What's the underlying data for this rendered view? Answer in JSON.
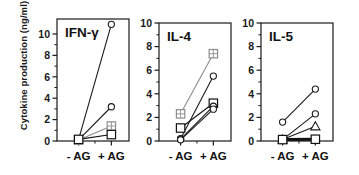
{
  "figure": {
    "ylabel": "Cytokine production (ng/ml)",
    "xticklabels": [
      "- AG",
      "+ AG"
    ],
    "yticklabels": [
      "0",
      "2",
      "4",
      "6",
      "8",
      "10"
    ],
    "panel_titles": [
      "IFN-γ",
      "IL-4",
      "IL-5"
    ]
  },
  "chart_data": {
    "type": "line",
    "title": "",
    "subtitle": "",
    "xlabel": "",
    "ylabel": "Cytokine production (ng/ml)",
    "x": [
      "- AG",
      "+ AG"
    ],
    "xlim": [
      0,
      1
    ],
    "ylim": [
      0,
      11.4
    ],
    "ytick_values": [
      0,
      2,
      4,
      6,
      8,
      10
    ],
    "minor_ticks": true,
    "grid": false,
    "legend": "none",
    "panels": [
      {
        "title": "IFN-γ",
        "categories": [
          "- AG",
          "+ AG"
        ],
        "ylim": [
          0,
          11.4
        ],
        "series": [
          {
            "name": "subject-1",
            "marker": "open-circle",
            "color": "#1a1a1a",
            "values": [
              0.15,
              10.9
            ]
          },
          {
            "name": "subject-2",
            "marker": "open-circle",
            "color": "#1a1a1a",
            "values": [
              0.1,
              3.2
            ]
          },
          {
            "name": "subject-3",
            "marker": "grid-square",
            "color": "#8c8c8c",
            "values": [
              0.1,
              1.4
            ]
          },
          {
            "name": "subject-4",
            "marker": "open-square",
            "color": "#111111",
            "values": [
              0.15,
              0.6
            ]
          }
        ]
      },
      {
        "title": "IL-4",
        "categories": [
          "- AG",
          "+ AG"
        ],
        "ylim": [
          0,
          10
        ],
        "series": [
          {
            "name": "subject-1",
            "marker": "grid-square",
            "color": "#8c8c8c",
            "values": [
              2.3,
              7.4
            ]
          },
          {
            "name": "subject-2",
            "marker": "open-circle",
            "color": "#1a1a1a",
            "values": [
              0.2,
              5.5
            ]
          },
          {
            "name": "subject-3",
            "marker": "open-square",
            "color": "#111111",
            "values": [
              1.1,
              3.2
            ]
          },
          {
            "name": "subject-4",
            "marker": "open-circle",
            "color": "#1a1a1a",
            "values": [
              0.15,
              2.95
            ]
          },
          {
            "name": "subject-5",
            "marker": "open-circle",
            "color": "#1a1a1a",
            "values": [
              0.1,
              2.7
            ]
          }
        ]
      },
      {
        "title": "IL-5",
        "categories": [
          "- AG",
          "+ AG"
        ],
        "ylim": [
          0,
          10
        ],
        "series": [
          {
            "name": "subject-1",
            "marker": "open-circle",
            "color": "#1a1a1a",
            "values": [
              1.6,
              4.4
            ]
          },
          {
            "name": "subject-2",
            "marker": "open-circle",
            "color": "#1a1a1a",
            "values": [
              0.12,
              2.3
            ]
          },
          {
            "name": "subject-3",
            "marker": "open-triangle",
            "color": "#1a1a1a",
            "values": [
              0.12,
              1.25
            ]
          },
          {
            "name": "subject-4",
            "marker": "open-square",
            "color": "#111111",
            "values": [
              0.12,
              0.15
            ]
          }
        ]
      }
    ]
  }
}
